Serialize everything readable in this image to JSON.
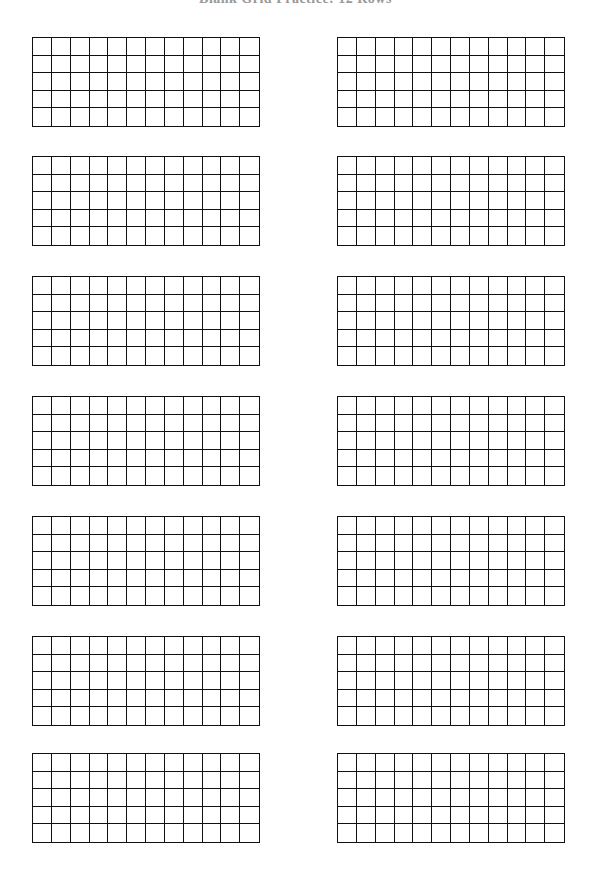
{
  "title": "Blank Grid Practice: 12 Rows",
  "layout": {
    "columns_x": [
      32,
      337
    ],
    "rows_y": [
      37,
      156,
      276,
      396,
      516,
      636,
      753
    ],
    "grid_cols": 12,
    "grid_rows": 5
  },
  "colors": {
    "line": "#111111",
    "background": "#ffffff"
  }
}
